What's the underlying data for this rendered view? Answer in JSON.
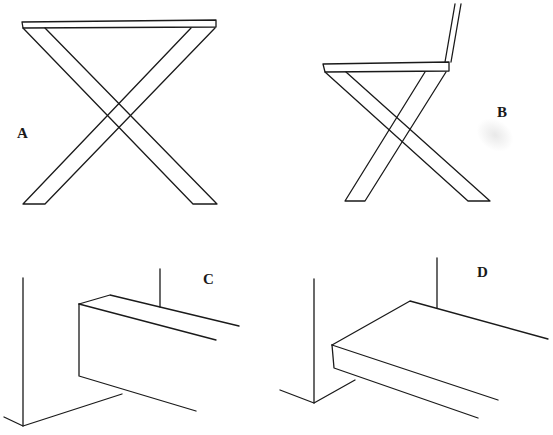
{
  "figure": {
    "panels": [
      {
        "id": "A",
        "label": "A",
        "description": "X-frame stool with flat top, front view"
      },
      {
        "id": "B",
        "label": "B",
        "description": "X-frame chair with seat and backrest, side view"
      },
      {
        "id": "C",
        "label": "C",
        "description": "Block/rail meeting a wall corner, perspective view"
      },
      {
        "id": "D",
        "label": "D",
        "description": "Flat slab meeting a wall corner, perspective view"
      }
    ],
    "caption": "",
    "colors": {
      "ink": "#1a1a1a",
      "paper": "#ffffff"
    }
  }
}
